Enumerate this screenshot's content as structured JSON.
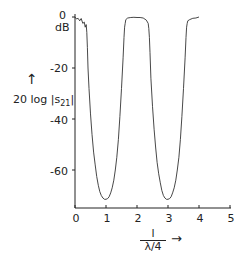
{
  "chart_data": {
    "type": "line",
    "title": "",
    "xlabel": "l / (λ/4)",
    "xlabel_parts": {
      "numerator": "l",
      "denominator": "λ/4",
      "arrow": "→"
    },
    "ylabel": "20 log |s21|",
    "ylabel_parts": {
      "prefix": "20 log |s",
      "subscript": "21",
      "suffix": "|",
      "arrow": "↑"
    },
    "yunit": "dB",
    "xlim": [
      0,
      5
    ],
    "ylim": [
      -75,
      0
    ],
    "xticks": [
      "0",
      "1",
      "2",
      "3",
      "4",
      "5"
    ],
    "yticks": [
      "0",
      "-20",
      "-40",
      "-60"
    ],
    "grid": false,
    "series": [
      {
        "name": "|s21|",
        "x": [
          0.0,
          0.05,
          0.1,
          0.15,
          0.2,
          0.25,
          0.3,
          0.33,
          0.36,
          0.38,
          0.4,
          0.42,
          0.45,
          0.5,
          0.55,
          0.6,
          0.65,
          0.7,
          0.75,
          0.8,
          0.85,
          0.9,
          0.95,
          1.0,
          1.05,
          1.1,
          1.15,
          1.2,
          1.25,
          1.3,
          1.35,
          1.4,
          1.45,
          1.5,
          1.55,
          1.58,
          1.6,
          1.62,
          1.64,
          1.7,
          1.8,
          1.9,
          2.0,
          2.1,
          2.2,
          2.3,
          2.36,
          2.38,
          2.4,
          2.42,
          2.45,
          2.5,
          2.55,
          2.6,
          2.65,
          2.7,
          2.75,
          2.8,
          2.85,
          2.9,
          2.95,
          3.0,
          3.05,
          3.1,
          3.15,
          3.2,
          3.25,
          3.3,
          3.35,
          3.4,
          3.45,
          3.5,
          3.55,
          3.58,
          3.6,
          3.62,
          3.64,
          3.7,
          3.8,
          3.9,
          4.0
        ],
        "y": [
          0.0,
          -0.8,
          -0.5,
          -1.5,
          -0.6,
          -2.5,
          -2.0,
          -4.0,
          -3.0,
          -6.0,
          -12,
          -20,
          -28,
          -38,
          -46,
          -53,
          -58,
          -62.5,
          -66,
          -68.5,
          -70,
          -71,
          -71.5,
          -71.5,
          -71.2,
          -70.5,
          -69,
          -67,
          -64,
          -60,
          -55,
          -48,
          -39,
          -28,
          -16,
          -8,
          -4,
          -2.5,
          -1.0,
          -0.4,
          -0.2,
          -0.1,
          -0.2,
          -0.2,
          -0.4,
          -1.2,
          -2.5,
          -4.5,
          -8,
          -14,
          -24,
          -35,
          -44,
          -51,
          -57,
          -61.5,
          -65,
          -68,
          -70,
          -71,
          -71.5,
          -71.5,
          -71.2,
          -70.5,
          -69,
          -67,
          -64,
          -60,
          -55,
          -48,
          -39,
          -28,
          -16,
          -8,
          -4,
          -2.5,
          -1.5,
          -1.0,
          -0.5,
          -0.4,
          0.0
        ]
      }
    ],
    "annotations": [
      "minima ≈ -70 dB at l/(λ/4) = 1 and 3"
    ]
  }
}
